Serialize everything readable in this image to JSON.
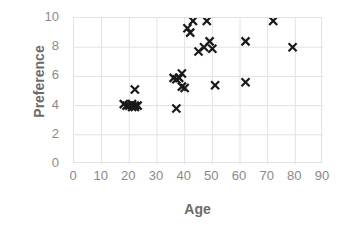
{
  "chart_data": {
    "type": "scatter",
    "title": "",
    "xlabel": "Age",
    "ylabel": "Preference",
    "xlim": [
      0,
      90
    ],
    "ylim": [
      0,
      10
    ],
    "xticks": [
      0,
      10,
      20,
      30,
      40,
      50,
      60,
      70,
      80,
      90
    ],
    "yticks": [
      0,
      2,
      4,
      6,
      8,
      10
    ],
    "grid": true,
    "legend": "none",
    "marker": "x",
    "marker_color": "#1a1a1a",
    "axis_text_color": "#8a8a8a",
    "axis_title_color": "#6b6b6b",
    "gridline_color": "#e2e2e2",
    "background_color": "#ffffff",
    "series": [
      {
        "name": "Preference vs Age",
        "points": [
          {
            "x": 18,
            "y": 4.1
          },
          {
            "x": 19,
            "y": 4.0
          },
          {
            "x": 20,
            "y": 4.0
          },
          {
            "x": 21,
            "y": 3.9
          },
          {
            "x": 21,
            "y": 4.1
          },
          {
            "x": 22,
            "y": 4.0
          },
          {
            "x": 22,
            "y": 3.9
          },
          {
            "x": 22,
            "y": 5.1
          },
          {
            "x": 23,
            "y": 4.0
          },
          {
            "x": 36,
            "y": 5.9
          },
          {
            "x": 37,
            "y": 3.8
          },
          {
            "x": 37,
            "y": 5.8
          },
          {
            "x": 38,
            "y": 5.9
          },
          {
            "x": 39,
            "y": 6.2
          },
          {
            "x": 39,
            "y": 5.3
          },
          {
            "x": 40,
            "y": 5.2
          },
          {
            "x": 41,
            "y": 9.3
          },
          {
            "x": 42,
            "y": 9.0
          },
          {
            "x": 43,
            "y": 9.8
          },
          {
            "x": 45,
            "y": 7.7
          },
          {
            "x": 47,
            "y": 8.0
          },
          {
            "x": 48,
            "y": 9.8
          },
          {
            "x": 49,
            "y": 8.4
          },
          {
            "x": 50,
            "y": 7.9
          },
          {
            "x": 51,
            "y": 5.4
          },
          {
            "x": 62,
            "y": 8.4
          },
          {
            "x": 62,
            "y": 5.6
          },
          {
            "x": 72,
            "y": 9.8
          },
          {
            "x": 79,
            "y": 8.0
          }
        ]
      }
    ]
  }
}
